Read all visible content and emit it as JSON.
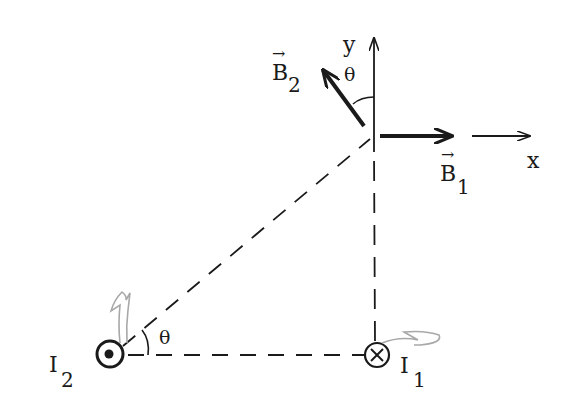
{
  "diagram": {
    "type": "physics-magnetic-field-vectors",
    "labels": {
      "axis_x": "x",
      "axis_y": "y",
      "field_1": {
        "symbol": "B",
        "subscript": "1",
        "vector_mark": "→"
      },
      "field_2": {
        "symbol": "B",
        "subscript": "2",
        "vector_mark": "→"
      },
      "current_1": {
        "symbol": "I",
        "subscript": "1"
      },
      "current_2": {
        "symbol": "I",
        "subscript": "2"
      },
      "angle_top": "θ",
      "angle_bottom": "θ"
    },
    "elements": {
      "current_1_direction": "into-page",
      "current_2_direction": "out-of-page",
      "line_style_geometry": "dashed"
    },
    "colors": {
      "ink": "#1a1a1a",
      "annotation_pencil": "#a8a8a8",
      "background": "#ffffff"
    }
  }
}
